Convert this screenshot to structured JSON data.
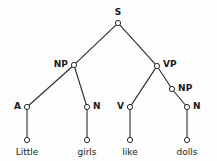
{
  "diagram": {
    "type": "syntax-tree",
    "sentence": "Little girls like dolls",
    "colors": {
      "background": "#fdfdfd",
      "stroke": "#2b2b2b",
      "node_fill": "#ffffff",
      "text": "#1a1a1a"
    },
    "nodes": [
      {
        "id": "s",
        "label": "S",
        "x": 118,
        "y": 23,
        "label_dx": 0,
        "label_dy": -11,
        "label_anchor": "center"
      },
      {
        "id": "np1",
        "label": "NP",
        "x": 74,
        "y": 65,
        "label_dx": -6,
        "label_dy": -1,
        "label_anchor": "right"
      },
      {
        "id": "vp",
        "label": "VP",
        "x": 157,
        "y": 66,
        "label_dx": 6,
        "label_dy": -2,
        "label_anchor": "left"
      },
      {
        "id": "np2",
        "label": "NP",
        "x": 172,
        "y": 89,
        "label_dx": 6,
        "label_dy": -1,
        "label_anchor": "left"
      },
      {
        "id": "a",
        "label": "A",
        "x": 27,
        "y": 107,
        "label_dx": -6,
        "label_dy": -1,
        "label_anchor": "right"
      },
      {
        "id": "n1",
        "label": "N",
        "x": 87,
        "y": 107,
        "label_dx": 6,
        "label_dy": -1,
        "label_anchor": "left"
      },
      {
        "id": "v",
        "label": "V",
        "x": 130,
        "y": 107,
        "label_dx": -6,
        "label_dy": -1,
        "label_anchor": "right"
      },
      {
        "id": "n2",
        "label": "N",
        "x": 187,
        "y": 107,
        "label_dx": 6,
        "label_dy": -1,
        "label_anchor": "left"
      },
      {
        "id": "leaf1",
        "label": "",
        "x": 27,
        "y": 140,
        "label_dx": 0,
        "label_dy": 0,
        "label_anchor": "center"
      },
      {
        "id": "leaf2",
        "label": "",
        "x": 87,
        "y": 140,
        "label_dx": 0,
        "label_dy": 0,
        "label_anchor": "center"
      },
      {
        "id": "leaf3",
        "label": "",
        "x": 130,
        "y": 140,
        "label_dx": 0,
        "label_dy": 0,
        "label_anchor": "center"
      },
      {
        "id": "leaf4",
        "label": "",
        "x": 187,
        "y": 140,
        "label_dx": 0,
        "label_dy": 0,
        "label_anchor": "center"
      }
    ],
    "edges": [
      {
        "from": "s",
        "to": "np1"
      },
      {
        "from": "s",
        "to": "vp"
      },
      {
        "from": "np1",
        "to": "a"
      },
      {
        "from": "np1",
        "to": "n1"
      },
      {
        "from": "vp",
        "to": "v"
      },
      {
        "from": "vp",
        "to": "np2"
      },
      {
        "from": "np2",
        "to": "n2"
      },
      {
        "from": "a",
        "to": "leaf1"
      },
      {
        "from": "n1",
        "to": "leaf2"
      },
      {
        "from": "v",
        "to": "leaf3"
      },
      {
        "from": "n2",
        "to": "leaf4"
      }
    ],
    "terminals": [
      {
        "id": "word1",
        "text": "Little",
        "x": 27,
        "y": 148
      },
      {
        "id": "word2",
        "text": "girls",
        "x": 87,
        "y": 148
      },
      {
        "id": "word3",
        "text": "like",
        "x": 130,
        "y": 148
      },
      {
        "id": "word4",
        "text": "dolls",
        "x": 187,
        "y": 148
      }
    ]
  }
}
